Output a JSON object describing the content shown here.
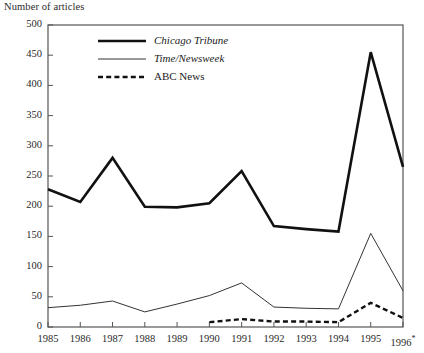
{
  "chart_data": {
    "type": "line",
    "title": "Number of articles",
    "xlabel": "",
    "ylabel": "Number of articles",
    "grid": false,
    "legend_position": "top-left-inside",
    "ylim": [
      0,
      500
    ],
    "yticks": [
      0,
      50,
      100,
      150,
      200,
      250,
      300,
      350,
      400,
      450,
      500
    ],
    "ytick_labels": [
      "0",
      "50",
      "100",
      "150",
      "200",
      "250",
      "300",
      "350",
      "400",
      "450",
      "500"
    ],
    "categories": [
      "1985",
      "1986",
      "1987",
      "1988",
      "1989",
      "1990",
      "1991",
      "1992",
      "1993",
      "1994",
      "1995",
      "1996"
    ],
    "xtick_labels": [
      "1985",
      "1986",
      "1987",
      "1988",
      "1989",
      "1990",
      "1991",
      "1992",
      "1993",
      "1994",
      "1995",
      "1996"
    ],
    "last_xtick_suffix": "*",
    "series": [
      {
        "name": "Chicago Tribune",
        "style": "thick-solid",
        "italic_label": true,
        "color": "#111111",
        "x": [
          "1985",
          "1986",
          "1987",
          "1988",
          "1989",
          "1990",
          "1991",
          "1992",
          "1993",
          "1994",
          "1995",
          "1996"
        ],
        "values": [
          228,
          207,
          280,
          199,
          198,
          205,
          258,
          167,
          162,
          158,
          455,
          265
        ]
      },
      {
        "name": "Time/Newsweek",
        "style": "thin-solid",
        "italic_label": true,
        "color": "#333333",
        "x": [
          "1985",
          "1986",
          "1987",
          "1988",
          "1989",
          "1990",
          "1991",
          "1992",
          "1993",
          "1994",
          "1995",
          "1996"
        ],
        "values": [
          32,
          36,
          43,
          25,
          38,
          52,
          73,
          33,
          31,
          30,
          155,
          60
        ]
      },
      {
        "name": "ABC News",
        "style": "dashed",
        "italic_label": false,
        "color": "#111111",
        "x": [
          "1990",
          "1991",
          "1992",
          "1993",
          "1994",
          "1995",
          "1996"
        ],
        "values": [
          8,
          13,
          9,
          9,
          8,
          40,
          15
        ]
      }
    ]
  },
  "legend": {
    "items": [
      {
        "label": "Chicago Tribune"
      },
      {
        "label": "Time/Newsweek"
      },
      {
        "label": "ABC News"
      }
    ]
  },
  "axis": {
    "y_title": "Number of articles"
  },
  "colors": {
    "frame": "#555555",
    "text": "#2a2a2a",
    "series_primary": "#111111"
  }
}
